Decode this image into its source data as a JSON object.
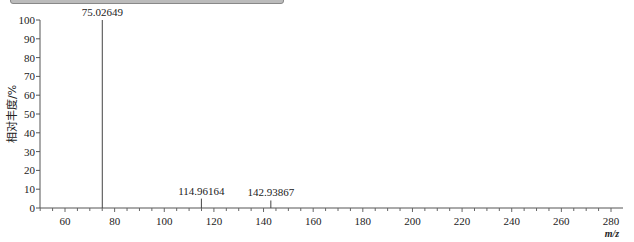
{
  "chart_data": {
    "type": "bar",
    "subtype": "mass-spectrum-stick",
    "title": "",
    "xlabel": "m/z",
    "ylabel": "相对丰度/%",
    "xlim": [
      50,
      285
    ],
    "ylim": [
      0,
      100
    ],
    "x_ticks": [
      60,
      80,
      100,
      120,
      140,
      160,
      180,
      200,
      220,
      240,
      260,
      280
    ],
    "y_ticks": [
      0,
      10,
      20,
      30,
      40,
      50,
      60,
      70,
      80,
      90,
      100
    ],
    "grid": false,
    "legend": null,
    "peaks": [
      {
        "mz": 75.02649,
        "intensity": 100,
        "label": "75.02649"
      },
      {
        "mz": 114.96164,
        "intensity": 5,
        "label": "114.96164"
      },
      {
        "mz": 142.93867,
        "intensity": 4,
        "label": "142.93867"
      }
    ]
  },
  "axis": {
    "ylabel": "相对丰度/%",
    "xlabel": "m/z",
    "y_tick_labels": [
      "0",
      "10",
      "20",
      "30",
      "40",
      "50",
      "60",
      "70",
      "80",
      "90",
      "100"
    ],
    "x_tick_labels": [
      "60",
      "80",
      "100",
      "120",
      "140",
      "160",
      "180",
      "200",
      "220",
      "240",
      "260",
      "280"
    ]
  }
}
